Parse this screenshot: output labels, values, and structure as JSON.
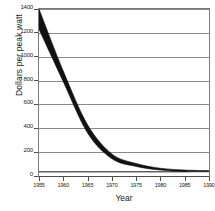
{
  "chart_data": {
    "type": "area",
    "title": "",
    "subtitle": "",
    "xlabel": "Year",
    "ylabel": "Dollars per peak watt",
    "xlim": [
      1955,
      1990
    ],
    "ylim": [
      0,
      1400
    ],
    "grid": true,
    "legend": null,
    "series_style": "uncertainty band (upper and lower bound) drawn as a solid black swath",
    "x": [
      1955,
      1960,
      1965,
      1970,
      1975,
      1980,
      1985,
      1990
    ],
    "series": [
      {
        "name": "Upper bound",
        "values": [
          1400,
          880,
          430,
          185,
          105,
          65,
          50,
          45
        ]
      },
      {
        "name": "Lower bound",
        "values": [
          1230,
          790,
          360,
          145,
          80,
          50,
          38,
          35
        ]
      }
    ],
    "x_ticks": [
      {
        "value": 1955,
        "label": "1955"
      },
      {
        "value": 1960,
        "label": "1960"
      },
      {
        "value": 1965,
        "label": "1965"
      },
      {
        "value": 1970,
        "label": "1970"
      },
      {
        "value": 1975,
        "label": "1975"
      },
      {
        "value": 1980,
        "label": "1980"
      },
      {
        "value": 1985,
        "label": "1985"
      },
      {
        "value": 1990,
        "label": "1990"
      }
    ],
    "y_ticks": [
      {
        "value": 0,
        "label": "0"
      },
      {
        "value": 200,
        "label": "200"
      },
      {
        "value": 400,
        "label": "400"
      },
      {
        "value": 600,
        "label": "600"
      },
      {
        "value": 800,
        "label": "800"
      },
      {
        "value": 1000,
        "label": "1000"
      },
      {
        "value": 1200,
        "label": "1200"
      },
      {
        "value": 1400,
        "label": "1400"
      }
    ],
    "gridline_values": [
      200,
      400,
      600,
      800,
      1000,
      1200,
      1400
    ],
    "colors": {
      "band": "#111111",
      "grid": "#8a8a8a",
      "axis": "#4d4d4d",
      "text": "#1a1a1a",
      "background": "#ffffff"
    }
  }
}
